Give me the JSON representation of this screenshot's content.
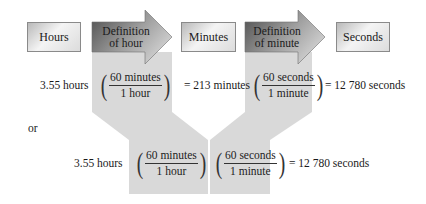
{
  "flow": {
    "boxes": [
      {
        "label": "Hours"
      },
      {
        "label": "Minutes"
      },
      {
        "label": "Seconds"
      }
    ],
    "arrows": [
      {
        "line1": "Definition",
        "line2": "of hour"
      },
      {
        "line1": "Definition",
        "line2": "of minute"
      }
    ]
  },
  "stepwise": {
    "start": "3.55 hours",
    "factor1": {
      "numerator": "60 minutes",
      "denominator": "1 hour"
    },
    "result1": "= 213 minutes",
    "factor2": {
      "numerator": "60 seconds",
      "denominator": "1 minute"
    },
    "result2": "= 12 780 seconds"
  },
  "connector": "or",
  "combined": {
    "start": "3.55  hours",
    "factor1": {
      "numerator": "60 minutes",
      "denominator": "1 hour"
    },
    "factor2": {
      "numerator": "60 seconds",
      "denominator": "1 minute"
    },
    "result": "= 12 780 seconds"
  },
  "colors": {
    "band": "#d9d9d9",
    "arrow_dark": "#5a5a5a",
    "arrow_light": "#cfcfcf",
    "box_border": "#8a8a8a"
  }
}
